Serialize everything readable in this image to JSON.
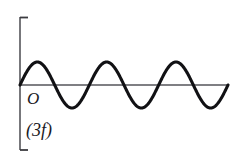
{
  "figure": {
    "name": "sine-waveform-diagram",
    "background_color": "#ffffff",
    "width": 240,
    "height": 161
  },
  "labels": {
    "origin": "O",
    "harmonic": "(3f)"
  },
  "axes": {
    "color": "#55555a",
    "tick_color": "#3b3b40",
    "y_axis": {
      "x": 20,
      "y_top": 17,
      "y_bottom": 150
    },
    "x_axis": {
      "y": 85,
      "x_left": 20,
      "x_right": 228
    },
    "ticks": [
      {
        "name": "y-axis-top-tick",
        "x1": 20,
        "y1": 17,
        "x2": 28,
        "y2": 17
      },
      {
        "name": "y-axis-bottom-tick",
        "x1": 20,
        "y1": 150,
        "x2": 28,
        "y2": 150
      }
    ]
  },
  "chart_data": {
    "type": "line",
    "title": "",
    "subtitle": "",
    "xlabel": "",
    "ylabel": "",
    "grid": false,
    "legend_position": "none",
    "annotations": [
      "O",
      "(3f)"
    ],
    "series": [
      {
        "name": "third-harmonic",
        "function": "y = A * sin(2*pi*x/T)",
        "color": "#111114",
        "stroke_width": 3.1,
        "cycles": 3,
        "amplitude_px": 23,
        "period_px": 69.33,
        "baseline_y_px": 85,
        "x_start_px": 20,
        "x_end_px": 228,
        "peak_y_px": 62,
        "trough_y_px": 108,
        "peaks_x_px": [
          37,
          106,
          176
        ],
        "troughs_x_px": [
          72,
          141,
          211
        ],
        "zero_crossings_x_px": [
          20,
          55,
          89,
          124,
          159,
          193,
          228
        ]
      }
    ],
    "xlim": [
      20,
      228
    ],
    "ylim": [
      62,
      108
    ]
  }
}
